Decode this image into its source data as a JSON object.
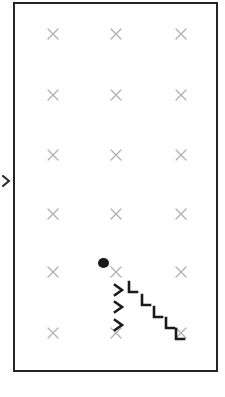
{
  "scene": {
    "title": "Grid Field",
    "width": 225,
    "height": 397,
    "background_color": "#ffffff"
  },
  "field": {
    "name": "play-field",
    "border_color": "#252525",
    "border_width": 2,
    "x": 13,
    "y": 2,
    "width": 205,
    "height": 370,
    "fill_color": "#ffffff"
  },
  "edge_marker": {
    "icon": "left-edge-arrow-icon",
    "color": "#2a2a2a",
    "x": 2,
    "y": 179
  },
  "grid": {
    "label": "target-grid",
    "marker_icon": "x-marker-icon",
    "marker_color": "#b0b0b0",
    "columns": [
      53,
      116,
      181
    ],
    "rows": [
      34,
      95,
      155,
      214,
      272,
      333
    ],
    "markers": [
      {
        "col": 0,
        "row": 0,
        "x": 53,
        "y": 34
      },
      {
        "col": 1,
        "row": 0,
        "x": 116,
        "y": 34
      },
      {
        "col": 2,
        "row": 0,
        "x": 181,
        "y": 34
      },
      {
        "col": 0,
        "row": 1,
        "x": 53,
        "y": 95
      },
      {
        "col": 1,
        "row": 1,
        "x": 116,
        "y": 95
      },
      {
        "col": 2,
        "row": 1,
        "x": 181,
        "y": 95
      },
      {
        "col": 0,
        "row": 2,
        "x": 53,
        "y": 155
      },
      {
        "col": 1,
        "row": 2,
        "x": 116,
        "y": 155
      },
      {
        "col": 2,
        "row": 2,
        "x": 181,
        "y": 155
      },
      {
        "col": 0,
        "row": 3,
        "x": 53,
        "y": 214
      },
      {
        "col": 1,
        "row": 3,
        "x": 116,
        "y": 214
      },
      {
        "col": 2,
        "row": 3,
        "x": 181,
        "y": 214
      },
      {
        "col": 0,
        "row": 4,
        "x": 53,
        "y": 272
      },
      {
        "col": 1,
        "row": 4,
        "x": 116,
        "y": 272
      },
      {
        "col": 2,
        "row": 4,
        "x": 181,
        "y": 272
      },
      {
        "col": 0,
        "row": 5,
        "x": 53,
        "y": 333
      },
      {
        "col": 1,
        "row": 5,
        "x": 116,
        "y": 333
      },
      {
        "col": 2,
        "row": 5,
        "x": 181,
        "y": 333
      }
    ]
  },
  "player": {
    "name": "player-dot",
    "icon": "filled-circle-icon",
    "color": "#1a1a1a",
    "x": 103,
    "y": 263,
    "radius": 5.5
  },
  "trail": {
    "label": "movement-trail",
    "color": "#1a1a1a",
    "marks": [
      {
        "index": 0,
        "icon": "chevron-right-icon",
        "shape": "right",
        "x": 119,
        "y": 290,
        "rotation": 0
      },
      {
        "index": 1,
        "icon": "chevron-corner-icon",
        "shape": "corner",
        "x": 133,
        "y": 288,
        "rotation": 0
      },
      {
        "index": 2,
        "icon": "chevron-right-icon",
        "shape": "right",
        "x": 119,
        "y": 307,
        "rotation": 0
      },
      {
        "index": 3,
        "icon": "chevron-corner-icon",
        "shape": "corner",
        "x": 146,
        "y": 301,
        "rotation": 0
      },
      {
        "index": 4,
        "icon": "chevron-corner-icon",
        "shape": "corner",
        "x": 158,
        "y": 313,
        "rotation": 0
      },
      {
        "index": 5,
        "icon": "chevron-right-icon",
        "shape": "right",
        "x": 119,
        "y": 325,
        "rotation": 0
      },
      {
        "index": 6,
        "icon": "chevron-corner-icon",
        "shape": "corner",
        "x": 170,
        "y": 324,
        "rotation": 0
      },
      {
        "index": 7,
        "icon": "chevron-corner-icon",
        "shape": "corner",
        "x": 180,
        "y": 335,
        "rotation": 0
      }
    ]
  }
}
